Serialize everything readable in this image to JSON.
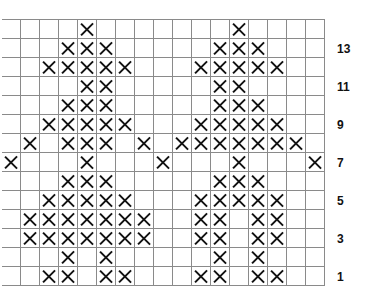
{
  "chart_data": {
    "type": "table",
    "title": "",
    "columns": 17,
    "rows": [
      {
        "row": 14,
        "label": "",
        "marked": [
          4,
          12
        ]
      },
      {
        "row": 13,
        "label": "13",
        "marked": [
          3,
          4,
          5,
          11,
          12,
          13
        ]
      },
      {
        "row": 12,
        "label": "",
        "marked": [
          2,
          3,
          4,
          5,
          6,
          10,
          11,
          12,
          13,
          14
        ]
      },
      {
        "row": 11,
        "label": "11",
        "marked": [
          4,
          5,
          11,
          12
        ]
      },
      {
        "row": 10,
        "label": "",
        "marked": [
          3,
          4,
          5,
          11,
          12,
          13
        ]
      },
      {
        "row": 9,
        "label": "9",
        "marked": [
          2,
          3,
          4,
          5,
          6,
          10,
          11,
          12,
          13,
          14
        ]
      },
      {
        "row": 8,
        "label": "",
        "marked": [
          1,
          3,
          4,
          5,
          7,
          9,
          10,
          11,
          12,
          13,
          14,
          15
        ]
      },
      {
        "row": 7,
        "label": "7",
        "marked": [
          0,
          4,
          8,
          12,
          16
        ]
      },
      {
        "row": 6,
        "label": "",
        "marked": [
          3,
          4,
          5,
          11,
          12,
          13
        ]
      },
      {
        "row": 5,
        "label": "5",
        "marked": [
          2,
          3,
          4,
          5,
          6,
          10,
          11,
          12,
          13,
          14
        ]
      },
      {
        "row": 4,
        "label": "",
        "marked": [
          1,
          2,
          3,
          4,
          5,
          6,
          7,
          10,
          11,
          13,
          14
        ]
      },
      {
        "row": 3,
        "label": "3",
        "marked": [
          1,
          2,
          3,
          4,
          5,
          6,
          7,
          10,
          11,
          13,
          14
        ]
      },
      {
        "row": 2,
        "label": "",
        "marked": [
          3,
          5,
          11,
          13
        ]
      },
      {
        "row": 1,
        "label": "1",
        "marked": [
          2,
          3,
          5,
          6,
          10,
          11,
          13,
          14
        ]
      }
    ],
    "row_labels": [
      "13",
      "11",
      "9",
      "7",
      "5",
      "3",
      "1"
    ],
    "symbol": "X",
    "grid": true
  },
  "colors": {
    "grid_line": "#8a8a8a",
    "mark": "#111111",
    "background": "#ffffff"
  }
}
